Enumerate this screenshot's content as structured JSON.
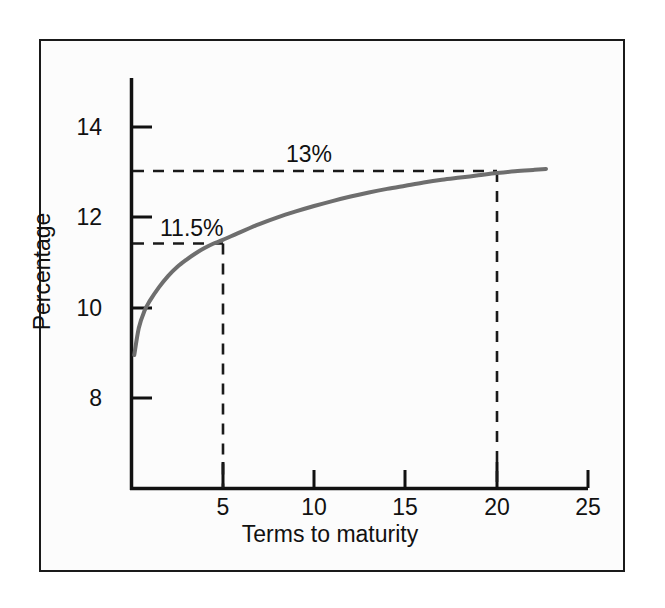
{
  "figure": {
    "background_color": "#ffffff",
    "panel_color": "#fcfcfc",
    "border_color": "#1a1a1a"
  },
  "chart_data": {
    "type": "line",
    "title": "",
    "subtitle": "",
    "xlabel": "Terms to maturity",
    "ylabel": "Percentage",
    "xlim": [
      0,
      25
    ],
    "ylim": [
      6.9,
      15.0
    ],
    "xticks": [
      5,
      10,
      15,
      20,
      25
    ],
    "xtick_labels": [
      "5",
      "10",
      "15",
      "20",
      "25"
    ],
    "yticks": [
      8,
      10,
      12,
      14
    ],
    "ytick_labels": [
      "8",
      "10",
      "12",
      "14"
    ],
    "grid": false,
    "legend": null,
    "series": [
      {
        "name": "Yield curve",
        "color": "#6e6e6e",
        "line_width": 4,
        "x": [
          0.15,
          0.4,
          0.7,
          1.0,
          1.5,
          2.0,
          2.5,
          3.0,
          3.5,
          4.0,
          4.5,
          5.0,
          6.0,
          7.0,
          8.0,
          9.0,
          10.0,
          11.0,
          12.0,
          13.0,
          14.0,
          15.0,
          16.0,
          17.0,
          18.0,
          19.0,
          20.0,
          21.0,
          22.0,
          22.7
        ],
        "y": [
          8.95,
          9.55,
          9.92,
          10.15,
          10.45,
          10.7,
          10.9,
          11.06,
          11.2,
          11.32,
          11.42,
          11.5,
          11.68,
          11.85,
          12.0,
          12.13,
          12.25,
          12.36,
          12.46,
          12.55,
          12.63,
          12.7,
          12.77,
          12.83,
          12.88,
          12.93,
          12.98,
          13.02,
          13.05,
          13.07
        ]
      }
    ],
    "annotations": [
      {
        "label": "13%",
        "value": 13,
        "x_at": 20,
        "type": "guide-lines",
        "style": "dashed",
        "color": "#1a1a1a"
      },
      {
        "label": "11.5%",
        "value": 11.5,
        "x_at": 5,
        "type": "guide-lines",
        "style": "dashed",
        "color": "#1a1a1a"
      }
    ]
  }
}
